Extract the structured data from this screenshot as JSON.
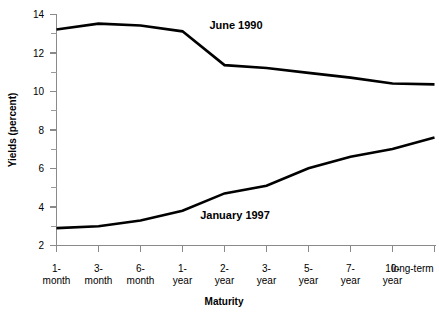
{
  "chart_data": {
    "type": "line",
    "title": "",
    "xlabel": "Maturity",
    "ylabel": "Yields (percent)",
    "ylim": [
      2,
      14
    ],
    "ytick_labels": [
      "2",
      "4",
      "6",
      "8",
      "10",
      "12",
      "14"
    ],
    "ytick_values": [
      2,
      4,
      6,
      8,
      10,
      12,
      14
    ],
    "yminor_values": [
      3,
      5,
      7,
      9,
      11,
      13
    ],
    "grid": false,
    "legend_position": "inline-annotation",
    "categories": [
      "1-\nmonth",
      "3-\nmonth",
      "6-\nmonth",
      "1-\nyear",
      "2-\nyear",
      "3-\nyear",
      "5-\nyear",
      "7-\nyear",
      "10-\nyear",
      "long-term"
    ],
    "categories_line1": [
      "1-",
      "3-",
      "6-",
      "1-",
      "2-",
      "3-",
      "5-",
      "7-",
      "10-",
      "long-term"
    ],
    "categories_line2": [
      "month",
      "month",
      "month",
      "year",
      "year",
      "year",
      "year",
      "year",
      "year",
      ""
    ],
    "series": [
      {
        "name": "June 1990",
        "color": "#000000",
        "values": [
          13.2,
          13.5,
          13.4,
          13.1,
          11.35,
          11.2,
          10.95,
          10.7,
          10.4,
          10.35
        ],
        "annotation": "June 1990"
      },
      {
        "name": "January 1997",
        "color": "#000000",
        "values": [
          2.9,
          3.0,
          3.3,
          3.8,
          4.7,
          5.1,
          6.0,
          6.6,
          7.0,
          7.6
        ],
        "annotation": "January 1997"
      }
    ]
  },
  "annotations": {
    "june_1990_label": "June 1990",
    "january_1997_label": "January 1997"
  },
  "axes": {
    "y_title": "Yields (percent)",
    "x_title": "Maturity"
  }
}
